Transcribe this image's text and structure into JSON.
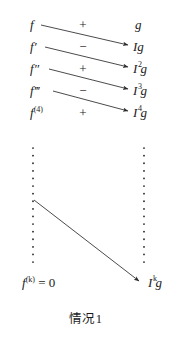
{
  "figure": {
    "caption": "情况1",
    "colors": {
      "ink": "#1a1a1a",
      "arrow": "#333333",
      "background": "#ffffff"
    },
    "columns": {
      "left_header": "derivatives",
      "middle_header": "signs",
      "right_header": "integrals"
    },
    "rows": [
      {
        "left": "f",
        "left_base": "f",
        "left_sup": "",
        "sign": "+",
        "right_base": "g",
        "right_sup": ""
      },
      {
        "left": "f′",
        "left_base": "f",
        "left_sup": "′",
        "sign": "−",
        "right_base": "Ig",
        "right_sup": ""
      },
      {
        "left": "f″",
        "left_base": "f",
        "left_sup": "″",
        "sign": "+",
        "right_base": "I g",
        "right_sup": "2"
      },
      {
        "left": "f‴",
        "left_base": "f",
        "left_sup": "‴",
        "sign": "−",
        "right_base": "I g",
        "right_sup": "3"
      },
      {
        "left": "f(4)",
        "left_base": "f",
        "left_sup": "(4)",
        "sign": "+",
        "right_base": "I g",
        "right_sup": "4"
      }
    ],
    "terminal": {
      "left_base": "f",
      "left_sup": "(k)",
      "left_equals": " = 0",
      "right_base": "I g",
      "right_sup": "k"
    },
    "vertical_dots": {
      "left_label": "left-ellipsis",
      "right_label": "right-ellipsis"
    },
    "signs_sequence": [
      "+",
      "−",
      "+",
      "−",
      "+"
    ]
  }
}
